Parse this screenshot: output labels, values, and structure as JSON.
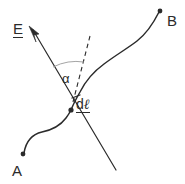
{
  "figure": {
    "type": "vector-geometry-diagram",
    "background_color": "#ffffff",
    "stroke_color": "#2b2b2b",
    "arc_color": "#9a9a9a",
    "labels": {
      "point_a": "A",
      "point_b": "B",
      "field_vector": "E",
      "angle": "α",
      "path_element_d": "d",
      "path_element_l": "ℓ"
    },
    "elements": {
      "curve_name": "path-curve-a-to-b",
      "field_line_name": "field-vector-line",
      "tangent_name": "tangent-dashed-line",
      "arc_name": "angle-arc"
    }
  },
  "geometry": {
    "point_a": {
      "x": 23,
      "y": 154
    },
    "point_b": {
      "x": 160,
      "y": 11
    },
    "intersection": {
      "x": 71,
      "y": 110
    },
    "arrow_tip": {
      "x": 30,
      "y": 27
    },
    "line_end": {
      "x": 116,
      "y": 170
    },
    "dashed_top": {
      "x": 90,
      "y": 36
    },
    "tick_mark": {
      "x": 76,
      "y": 97
    }
  }
}
